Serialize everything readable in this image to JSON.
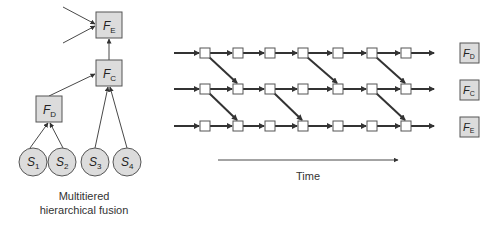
{
  "hierarchy": {
    "caption_line1": "Multitiered",
    "caption_line2": "hierarchical fusion",
    "fusion_nodes": [
      {
        "id": "FE",
        "letter": "F",
        "sub": "E"
      },
      {
        "id": "FC",
        "letter": "F",
        "sub": "C"
      },
      {
        "id": "FD",
        "letter": "F",
        "sub": "D"
      }
    ],
    "sensors": [
      {
        "id": "S1",
        "letter": "S",
        "sub": "1"
      },
      {
        "id": "S2",
        "letter": "S",
        "sub": "2"
      },
      {
        "id": "S3",
        "letter": "S",
        "sub": "3"
      },
      {
        "id": "S4",
        "letter": "S",
        "sub": "4"
      }
    ]
  },
  "timeline": {
    "axis_label": "Time",
    "rows": 3,
    "nodes_per_row": 7,
    "legend": [
      {
        "id": "FD",
        "letter": "F",
        "sub": "D"
      },
      {
        "id": "FC",
        "letter": "F",
        "sub": "C"
      },
      {
        "id": "FE",
        "letter": "F",
        "sub": "E"
      }
    ],
    "diagonals": [
      {
        "from_row": 1,
        "from_node": 1,
        "to_row": 2,
        "to_node": 2
      },
      {
        "from_row": 2,
        "from_node": 1,
        "to_row": 3,
        "to_node": 2
      },
      {
        "from_row": 2,
        "from_node": 3,
        "to_row": 3,
        "to_node": 4
      },
      {
        "from_row": 1,
        "from_node": 4,
        "to_row": 2,
        "to_node": 5
      },
      {
        "from_row": 1,
        "from_node": 6,
        "to_row": 2,
        "to_node": 7
      },
      {
        "from_row": 2,
        "from_node": 6,
        "to_row": 3,
        "to_node": 7
      }
    ]
  },
  "colors": {
    "box_fill": "#dcdcdc",
    "box_stroke": "#555555",
    "line": "#333333",
    "node_fill": "#ffffff"
  }
}
